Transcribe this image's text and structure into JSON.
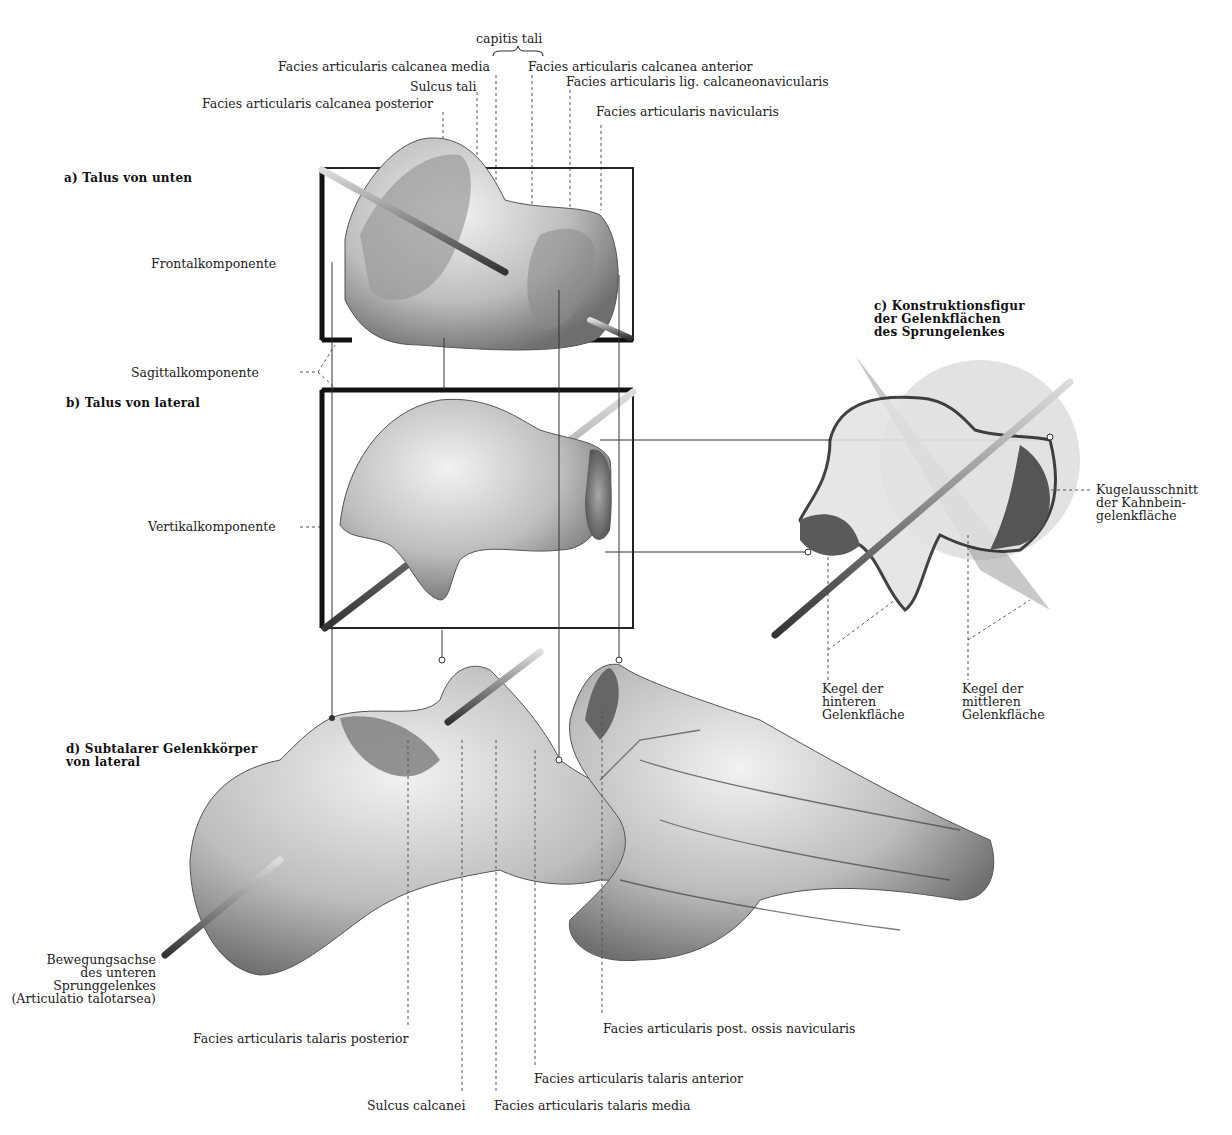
{
  "figure": {
    "panels": {
      "a": {
        "title": "a) Talus von unten"
      },
      "b": {
        "title": "b) Talus von lateral"
      },
      "c": {
        "title_lines": [
          "c) Konstruktionsfigur",
          "der Gelenkflächen",
          "des Sprungelenkes"
        ]
      },
      "d": {
        "title_lines": [
          "d) Subtalarer Gelenkkörper",
          "von lateral"
        ]
      }
    },
    "top_labels": {
      "capitis_tali": "capitis tali",
      "calcanea_media": "Facies articularis calcanea media",
      "calcanea_anterior": "Facies articularis calcanea anterior",
      "sulcus_tali": "Sulcus tali",
      "lig_calcaneonavicularis": "Facies articularis lig. calcaneonavicularis",
      "calcanea_posterior": "Facies articularis calcanea posterior",
      "navicularis": "Facies articularis navicularis"
    },
    "left_labels": {
      "frontal": "Frontalkomponente",
      "sagittal": "Sagittalkomponente",
      "vertikal": "Vertikalkomponente",
      "axis_lines": [
        "Bewegungsachse",
        "des unteren",
        "Sprunggelenkes",
        "(Articulatio talotarsea)"
      ]
    },
    "right_labels": {
      "kugel_lines": [
        "Kugelausschnitt",
        "der Kahnbein-",
        "gelenkfläche"
      ],
      "kegel_hinten_lines": [
        "Kegel der",
        "hinteren",
        "Gelenkfläche"
      ],
      "kegel_mitte_lines": [
        "Kegel der",
        "mittleren",
        "Gelenkfläche"
      ]
    },
    "bottom_labels": {
      "talaris_posterior": "Facies articularis talaris posterior",
      "post_ossis_navicularis": "Facies articularis post. ossis navicularis",
      "talaris_anterior": "Facies articularis talaris anterior",
      "sulcus_calcanei": "Sulcus calcanei",
      "talaris_media": "Facies articularis talaris media"
    }
  }
}
